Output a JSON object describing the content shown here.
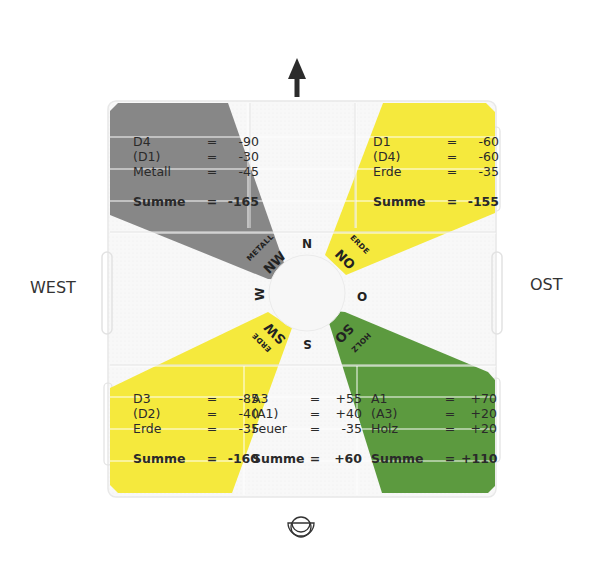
{
  "labels": {
    "west": "WEST",
    "east": "OST"
  },
  "icons": {
    "top": "north-arrow-icon",
    "bottom": "entrance-symbol-icon"
  },
  "colors": {
    "metal_gray": "#878787",
    "earth_yellow": "#f5e93d",
    "wood_green": "#5c9a3f",
    "board_bg": "#f7f7f7",
    "grid_line": "#e6e6e6"
  },
  "compass": {
    "N": "N",
    "NO": "NO",
    "O": "O",
    "SO": "SO",
    "S": "S",
    "SW": "SW",
    "W": "W",
    "NW": "NW"
  },
  "elements": {
    "NW": "METALL",
    "NO": "ERDE",
    "SW": "ERDE",
    "SO": "HOLZ"
  },
  "sectors": {
    "NW": {
      "rows": [
        {
          "k": "D4",
          "eq": "=",
          "v": "-90"
        },
        {
          "k": "(D1)",
          "eq": "=",
          "v": "-30"
        },
        {
          "k": "Metall",
          "eq": "=",
          "v": "-45"
        }
      ],
      "sum": {
        "k": "Summe",
        "eq": "=",
        "v": "-165"
      }
    },
    "NO": {
      "rows": [
        {
          "k": "D1",
          "eq": "=",
          "v": "-60"
        },
        {
          "k": "(D4)",
          "eq": "=",
          "v": "-60"
        },
        {
          "k": "Erde",
          "eq": "=",
          "v": "-35"
        }
      ],
      "sum": {
        "k": "Summe",
        "eq": "=",
        "v": "-155"
      }
    },
    "SW": {
      "rows": [
        {
          "k": "D3",
          "eq": "=",
          "v": "-85"
        },
        {
          "k": "(D2)",
          "eq": "=",
          "v": "-40"
        },
        {
          "k": "Erde",
          "eq": "=",
          "v": "-35"
        }
      ],
      "sum": {
        "k": "Summe",
        "eq": "=",
        "v": "-160"
      }
    },
    "S": {
      "rows": [
        {
          "k": "A3",
          "eq": "=",
          "v": "+55"
        },
        {
          "k": "(A1)",
          "eq": "=",
          "v": "+40"
        },
        {
          "k": "Feuer",
          "eq": "=",
          "v": "-35"
        }
      ],
      "sum": {
        "k": "Summe",
        "eq": "=",
        "v": "+60"
      }
    },
    "SO": {
      "rows": [
        {
          "k": "A1",
          "eq": "=",
          "v": "+70"
        },
        {
          "k": "(A3)",
          "eq": "=",
          "v": "+20"
        },
        {
          "k": "Holz",
          "eq": "=",
          "v": "+20"
        }
      ],
      "sum": {
        "k": "Summe",
        "eq": "=",
        "v": "+110"
      }
    }
  }
}
